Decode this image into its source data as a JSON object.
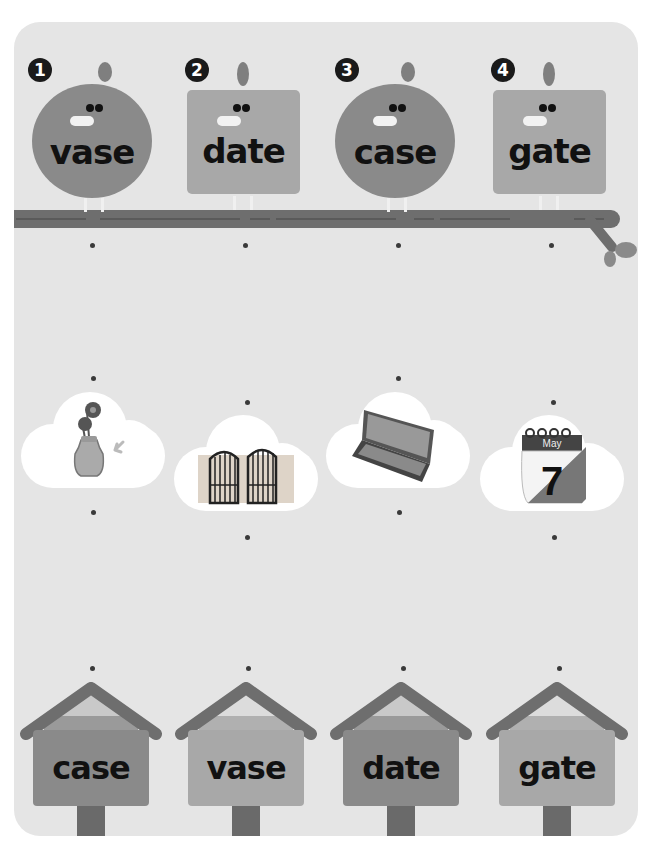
{
  "colors": {
    "panel_bg": "#e5e5e5",
    "bird_round": "#8a8a8a",
    "bird_square": "#a8a8a8",
    "branch": "#6e6e6e",
    "house_dark": "#8a8a8a",
    "house_light": "#a8a8a8",
    "roof": "#6e6e6e",
    "dot": "#3a3a3a"
  },
  "birds": [
    {
      "number": "1",
      "word": "vase",
      "shape": "round"
    },
    {
      "number": "2",
      "word": "date",
      "shape": "square"
    },
    {
      "number": "3",
      "word": "case",
      "shape": "round"
    },
    {
      "number": "4",
      "word": "gate",
      "shape": "square"
    }
  ],
  "pictures": [
    {
      "icon": "vase-with-flowers-icon",
      "label": ""
    },
    {
      "icon": "iron-gate-icon",
      "label": ""
    },
    {
      "icon": "pencil-case-icon",
      "label": ""
    },
    {
      "icon": "calendar-icon",
      "month": "May",
      "day": "7"
    }
  ],
  "houses": [
    {
      "word": "case"
    },
    {
      "word": "vase"
    },
    {
      "word": "date"
    },
    {
      "word": "gate"
    }
  ]
}
